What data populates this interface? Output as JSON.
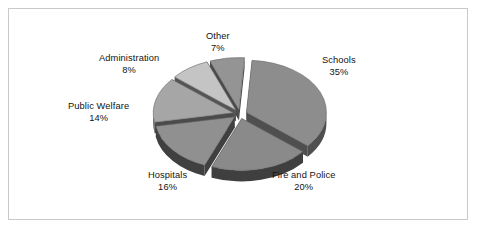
{
  "frame": {
    "border_color": "#c9c9c9",
    "background": "#ffffff"
  },
  "chart_data": {
    "type": "pie",
    "title": "",
    "subtitle": "",
    "xlabel": "",
    "ylabel": "",
    "legend_position": "none",
    "grid": false,
    "exploded": true,
    "three_d": true,
    "units": "percent",
    "total": 100,
    "categories": [
      "Schools",
      "Fire and Police",
      "Hospitals",
      "Public Welfare",
      "Administration",
      "Other"
    ],
    "values": [
      35,
      20,
      16,
      14,
      8,
      7
    ],
    "slices": [
      {
        "name": "Schools",
        "value": 35,
        "label": "Schools",
        "value_label": "35%",
        "top_color": "#8d8d8d",
        "side_color": "#4f4f4f",
        "label_x": 322,
        "label_y": 55
      },
      {
        "name": "Fire and Police",
        "value": 20,
        "label": "Fire and Police",
        "value_label": "20%",
        "top_color": "#8a8a8a",
        "side_color": "#3f3f3f",
        "label_x": 272,
        "label_y": 170
      },
      {
        "name": "Hospitals",
        "value": 16,
        "label": "Hospitals",
        "value_label": "16%",
        "top_color": "#909090",
        "side_color": "#404040",
        "label_x": 148,
        "label_y": 170
      },
      {
        "name": "Public Welfare",
        "value": 14,
        "label": "Public Welfare",
        "value_label": "14%",
        "top_color": "#a6a6a6",
        "side_color": "#4b4b4b",
        "label_x": 68,
        "label_y": 101
      },
      {
        "name": "Administration",
        "value": 8,
        "label": "Administration",
        "value_label": "8%",
        "top_color": "#c4c4c4",
        "side_color": "#555555",
        "label_x": 99,
        "label_y": 53
      },
      {
        "name": "Other",
        "value": 7,
        "label": "Other",
        "value_label": "7%",
        "top_color": "#949494",
        "side_color": "#4a4a4a",
        "label_x": 206,
        "label_y": 31
      }
    ],
    "geometry": {
      "center_x": 240,
      "center_y": 114,
      "radius_x": 80,
      "radius_y": 52,
      "depth": 11,
      "explode": 7,
      "start_angle_deg": -86
    }
  }
}
